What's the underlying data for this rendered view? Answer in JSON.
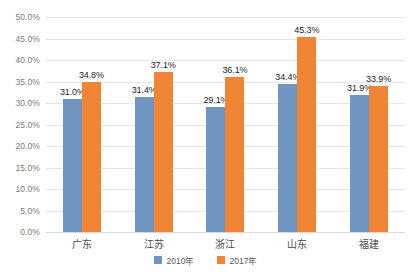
{
  "chart_data": {
    "type": "bar",
    "title": "",
    "subtitle": "",
    "xlabel": "",
    "ylabel": "",
    "categories": [
      "广东",
      "江苏",
      "浙江",
      "山东",
      "福建"
    ],
    "series": [
      {
        "name": "2010年",
        "color": "#6f96c1",
        "values": [
          31.0,
          31.4,
          29.1,
          34.4,
          31.9
        ],
        "labels": [
          "31.0%",
          "31.4%",
          "29.1%",
          "34.4%",
          "31.9%"
        ]
      },
      {
        "name": "2017年",
        "color": "#ef8535",
        "values": [
          34.8,
          37.1,
          36.1,
          45.3,
          33.9
        ],
        "labels": [
          "34.8%",
          "37.1%",
          "36.1%",
          "45.3%",
          "33.9%"
        ]
      }
    ],
    "ylim": [
      0,
      50
    ],
    "ytick_step": 5,
    "ytick_labels": [
      "50.0%",
      "45.0%",
      "40.0%",
      "35.0%",
      "30.0%",
      "25.0%",
      "20.0%",
      "15.0%",
      "10.0%",
      "5.0%",
      "0.0%"
    ],
    "ytick_values": [
      50,
      45,
      40,
      35,
      30,
      25,
      20,
      15,
      10,
      5,
      0
    ],
    "grid": true,
    "grid_color": "#e6e6e6",
    "legend_position": "bottom",
    "legend": [
      "2010年",
      "2017年"
    ],
    "background": "#ffffff"
  }
}
